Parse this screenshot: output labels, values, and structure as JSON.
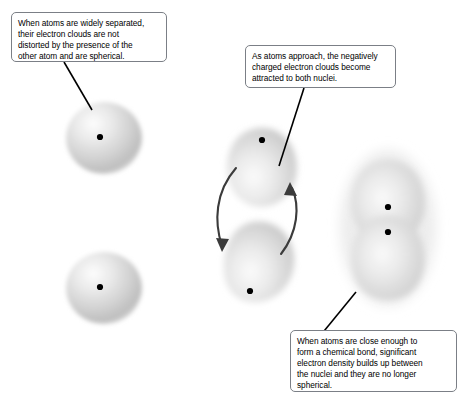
{
  "figure": {
    "background_color": "#ffffff",
    "callout_border_color": "#7b7f86",
    "atom_cloud_color": "#cfcfcf",
    "nucleus_color": "#000000"
  },
  "callouts": [
    {
      "id": "widely-separated",
      "text": "When atoms are widely separated,\ntheir electron clouds are not\ndistorted by the presence of the\nother atom and are spherical."
    },
    {
      "id": "atoms-approach",
      "text": "As atoms approach, the negatively\ncharged electron clouds become\nattracted to both nuclei."
    },
    {
      "id": "chemical-bond",
      "text": "When atoms are close enough to\nform a chemical bond, significant\nelectron density builds up between\nthe nuclei and they are no longer\nspherical."
    }
  ],
  "panels": [
    {
      "id": "separated-atoms",
      "label": "Two widely separated spherical atoms",
      "atoms": [
        {
          "id": "separated-atom-top",
          "shape": "sphere"
        },
        {
          "id": "separated-atom-bottom",
          "shape": "sphere"
        }
      ]
    },
    {
      "id": "approaching-atoms",
      "label": "Two approaching distorted atoms",
      "atoms": [
        {
          "id": "approaching-atom-top",
          "shape": "teardrop"
        },
        {
          "id": "approaching-atom-bottom",
          "shape": "teardrop"
        }
      ],
      "arrows": [
        {
          "id": "attraction-arrow-left",
          "direction": "downward"
        },
        {
          "id": "attraction-arrow-right",
          "direction": "upward"
        }
      ]
    },
    {
      "id": "bonded-atoms",
      "label": "Bonded atom pair with shared electron density",
      "atoms": [
        {
          "id": "bonded-atom-top",
          "shape": "merged-lobe"
        },
        {
          "id": "bonded-atom-bottom",
          "shape": "merged-lobe"
        }
      ]
    }
  ],
  "leader_lines": [
    {
      "id": "leader-widely-separated",
      "from": "callout-widely-separated",
      "to": "separated-atom-top"
    },
    {
      "id": "leader-atoms-approach",
      "from": "callout-atoms-approach",
      "to": "approaching-atom-top"
    },
    {
      "id": "leader-chemical-bond",
      "from": "callout-chemical-bond",
      "to": "bonded-atom-bottom"
    }
  ]
}
